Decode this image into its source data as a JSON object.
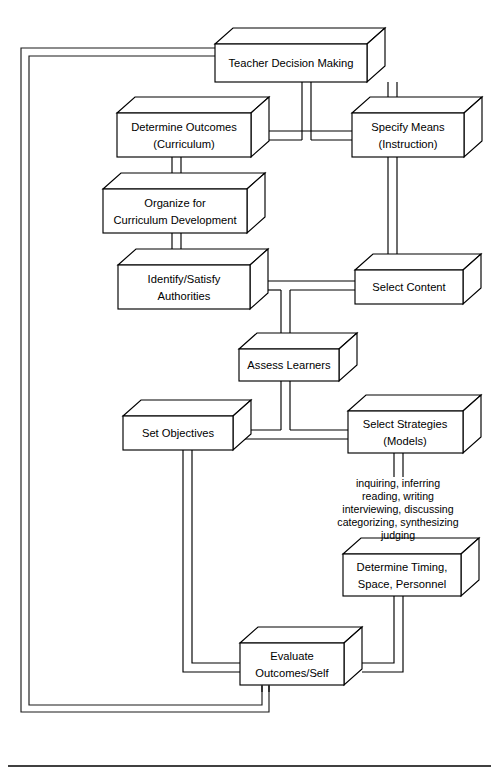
{
  "diagram": {
    "style": "isometric-3d-block-flowchart",
    "nodes": [
      {
        "id": "teacher_decision_making",
        "label": "Teacher Decision Making",
        "lines": [
          "Teacher Decision Making"
        ],
        "x": 215,
        "y": 44,
        "w": 152,
        "h": 38
      },
      {
        "id": "determine_outcomes",
        "label": "Determine Outcomes (Curriculum)",
        "lines": [
          "Determine Outcomes",
          "(Curriculum)"
        ],
        "x": 117,
        "y": 113,
        "w": 134,
        "h": 44
      },
      {
        "id": "specify_means",
        "label": "Specify Means (Instruction)",
        "lines": [
          "Specify Means",
          "(Instruction)"
        ],
        "x": 352,
        "y": 113,
        "w": 112,
        "h": 44
      },
      {
        "id": "organize_curriculum",
        "label": "Organize for Curriculum Development",
        "lines": [
          "Organize for",
          "Curriculum Development"
        ],
        "x": 103,
        "y": 189,
        "w": 144,
        "h": 44
      },
      {
        "id": "identify_authorities",
        "label": "Identify/Satisfy Authorities",
        "lines": [
          "Identify/Satisfy",
          "Authorities"
        ],
        "x": 118,
        "y": 265,
        "w": 132,
        "h": 44
      },
      {
        "id": "select_content",
        "label": "Select Content",
        "lines": [
          "Select Content"
        ],
        "x": 355,
        "y": 270,
        "w": 108,
        "h": 34
      },
      {
        "id": "assess_learners",
        "label": "Assess Learners",
        "lines": [
          "Assess Learners"
        ],
        "x": 239,
        "y": 349,
        "w": 100,
        "h": 32
      },
      {
        "id": "set_objectives",
        "label": "Set Objectives",
        "lines": [
          "Set Objectives"
        ],
        "x": 123,
        "y": 416,
        "w": 110,
        "h": 34
      },
      {
        "id": "select_strategies",
        "label": "Select Strategies (Models)",
        "lines": [
          "Select Strategies",
          "(Models)"
        ],
        "x": 348,
        "y": 411,
        "w": 115,
        "h": 42
      },
      {
        "id": "determine_timing",
        "label": "Determine Timing, Space, Personnel",
        "lines": [
          "Determine Timing,",
          "Space, Personnel"
        ],
        "x": 343,
        "y": 554,
        "w": 118,
        "h": 42
      },
      {
        "id": "evaluate_outcomes",
        "label": "Evaluate Outcomes/Self",
        "lines": [
          "Evaluate",
          "Outcomes/Self"
        ],
        "x": 240,
        "y": 643,
        "w": 104,
        "h": 42
      }
    ],
    "annotation": {
      "id": "strategy_examples",
      "x": 390,
      "y": 482,
      "lines": [
        "inquiring, inferring",
        "reading, writing",
        "interviewing, discussing",
        "categorizing, synthesizing",
        "judging"
      ]
    },
    "colors": {
      "stroke": "#000000",
      "fill": "#ffffff",
      "background": "#ffffff"
    }
  }
}
